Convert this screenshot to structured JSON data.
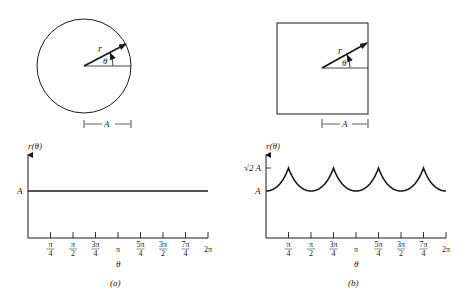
{
  "panels": [
    {
      "id": "a",
      "caption": "(a)",
      "shape": "circle",
      "shape_labels": {
        "radius": "r",
        "angle": "θ",
        "dimension": "A"
      },
      "axis": {
        "ylabel": "r(θ)",
        "xlabel": "θ"
      }
    },
    {
      "id": "b",
      "caption": "(b)",
      "shape": "square",
      "shape_labels": {
        "radius": "r",
        "angle": "θ",
        "dimension": "A"
      },
      "axis": {
        "ylabel": "r(θ)",
        "xlabel": "θ"
      }
    }
  ],
  "chart_data": [
    {
      "type": "line",
      "title": "(a) Circle: r(θ) = A",
      "xlabel": "θ",
      "ylabel": "r(θ)",
      "x_ticks": [
        "π/4",
        "π/2",
        "3π/4",
        "π",
        "5π/4",
        "3π/2",
        "7π/4",
        "2π"
      ],
      "y_ticks": [
        "A"
      ],
      "series": [
        {
          "name": "r(θ)",
          "x": [
            0,
            6.2832
          ],
          "values": [
            1,
            1
          ]
        }
      ],
      "ylim": [
        0,
        1.6
      ],
      "grid": false
    },
    {
      "type": "line",
      "title": "(b) Square: r(θ) = A / max(|cos θ|, |sin θ|)",
      "xlabel": "θ",
      "ylabel": "r(θ)",
      "x_ticks": [
        "π/4",
        "π/2",
        "3π/4",
        "π",
        "5π/4",
        "3π/2",
        "7π/4",
        "2π"
      ],
      "y_ticks": [
        "A",
        "√2 A"
      ],
      "series": [
        {
          "name": "r(θ)",
          "x": [
            0,
            0.7854,
            1.5708,
            2.3562,
            3.1416,
            3.927,
            4.7124,
            5.4978,
            6.2832
          ],
          "values": [
            1,
            1.414,
            1,
            1.414,
            1,
            1.414,
            1,
            1.414,
            1
          ]
        }
      ],
      "ylim": [
        0,
        1.6
      ],
      "grid": false
    }
  ],
  "labels": {
    "A": "A",
    "sqrt2A": "√2 A",
    "r": "r",
    "theta": "θ",
    "r_theta": "r(θ)",
    "caption_a": "(a)",
    "caption_b": "(b)",
    "ticks": [
      {
        "num": "π",
        "den": "4"
      },
      {
        "num": "π",
        "den": "2"
      },
      {
        "num": "3π",
        "den": "4"
      },
      {
        "num": "π",
        "den": ""
      },
      {
        "num": "5π",
        "den": "4"
      },
      {
        "num": "3π",
        "den": "2"
      },
      {
        "num": "7π",
        "den": "4"
      },
      {
        "num": "2π",
        "den": ""
      }
    ]
  }
}
